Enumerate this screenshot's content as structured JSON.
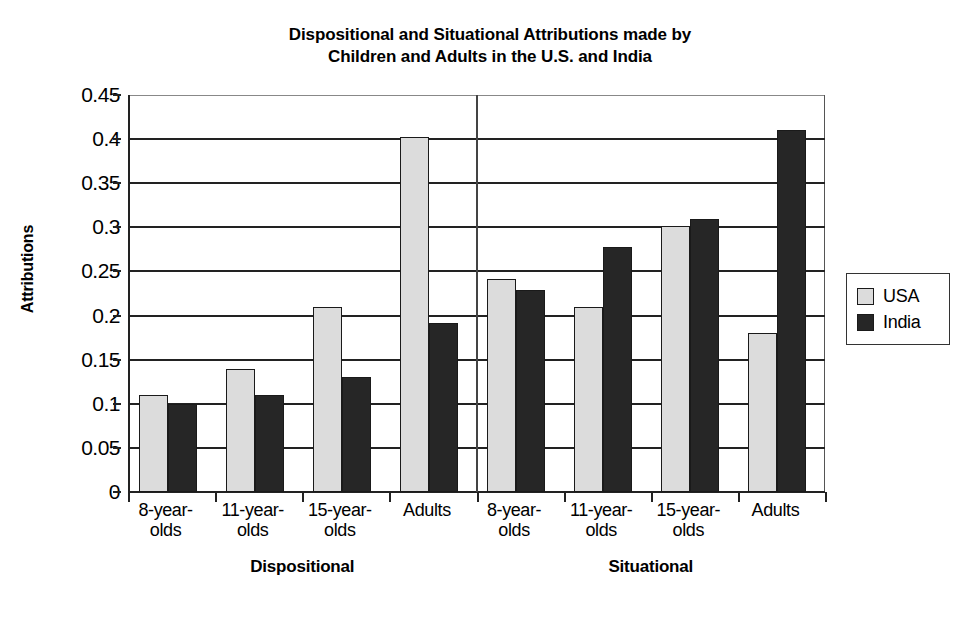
{
  "chart_data": {
    "type": "bar",
    "title": "Dispositional and Situational Attributions made by Children and Adults in the U.S. and India",
    "title_line1": "Dispositional and Situational Attributions made by",
    "title_line2": "Children and Adults in the U.S. and India",
    "xlabel": "",
    "ylabel": "Attributions",
    "ylim": [
      0,
      0.45
    ],
    "ytick_labels": [
      "0.45",
      "0.4",
      "0.35",
      "0.3",
      "0.25",
      "0.2",
      "0.15",
      "0.1",
      "0.05",
      "0"
    ],
    "ytick_values": [
      0.45,
      0.4,
      0.35,
      0.3,
      0.25,
      0.2,
      0.15,
      0.1,
      0.05,
      0
    ],
    "grid": true,
    "legend_position": "right",
    "categories": [
      "8-year-olds",
      "11-year-olds",
      "15-year-olds",
      "Adults",
      "8-year-olds",
      "11-year-olds",
      "15-year-olds",
      "Adults"
    ],
    "category_lines": [
      [
        "8-year-",
        "olds"
      ],
      [
        "11-year-",
        "olds"
      ],
      [
        "15-year-",
        "olds"
      ],
      [
        "Adults",
        ""
      ],
      [
        "8-year-",
        "olds"
      ],
      [
        "11-year-",
        "olds"
      ],
      [
        "15-year-",
        "olds"
      ],
      [
        "Adults",
        ""
      ]
    ],
    "supergroups": [
      {
        "label": "Dispositional",
        "categories": [
          "8-year-olds",
          "11-year-olds",
          "15-year-olds",
          "Adults"
        ]
      },
      {
        "label": "Situational",
        "categories": [
          "8-year-olds",
          "11-year-olds",
          "15-year-olds",
          "Adults"
        ]
      }
    ],
    "series": [
      {
        "name": "USA",
        "color": "#dcdcdc",
        "values": [
          0.11,
          0.14,
          0.21,
          0.402,
          0.241,
          0.21,
          0.302,
          0.18
        ]
      },
      {
        "name": "India",
        "color": "#262626",
        "values": [
          0.1,
          0.11,
          0.13,
          0.192,
          0.229,
          0.278,
          0.31,
          0.41
        ]
      }
    ]
  },
  "legend": {
    "items": [
      {
        "label": "USA",
        "swatch": "usa"
      },
      {
        "label": "India",
        "swatch": "india"
      }
    ]
  },
  "colors": {
    "usa": "#dcdcdc",
    "india": "#262626",
    "axis": "#222222",
    "background": "#ffffff"
  }
}
